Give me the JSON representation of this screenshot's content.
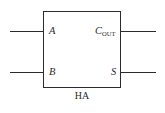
{
  "diagram": {
    "type": "logic-block-diagram",
    "caption": "HA",
    "block": {
      "name": "half-adder-block",
      "border_color": "#2b2b2b",
      "fill_color": "#ffffff"
    },
    "ports": {
      "input_a": {
        "label": "A",
        "side": "left",
        "position": "top"
      },
      "input_b": {
        "label": "B",
        "side": "left",
        "position": "bottom"
      },
      "output_carry": {
        "label_base": "C",
        "label_sub": "OUT",
        "side": "right",
        "position": "top"
      },
      "output_sum": {
        "label": "S",
        "side": "right",
        "position": "bottom"
      }
    },
    "wires": {
      "in_a": "input-wire-a",
      "in_b": "input-wire-b",
      "out_carry": "output-wire-cout",
      "out_sum": "output-wire-s"
    },
    "background_color": "#ffffff"
  }
}
